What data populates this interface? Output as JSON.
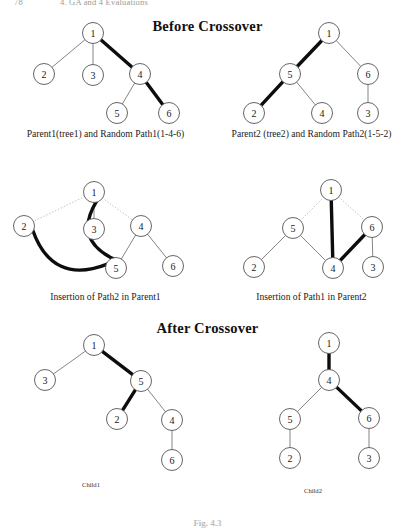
{
  "running_head": {
    "folio": "78",
    "text": "4. GA and 4 Evaluations"
  },
  "figure_number": "Fig. 4.3",
  "headings": {
    "before": "Before Crossover",
    "after": "After Crossover"
  },
  "captions": {
    "parent1": "Parent1(tree1) and Random Path1(1-4-6)",
    "parent2": "Parent2 (tree2) and Random Path2(1-5-2)",
    "insertion1": "Insertion of Path2  in Parent1",
    "insertion2": "Insertion of Path1  in Parent2",
    "child1": "Child1",
    "child2": "Child2"
  },
  "colors": {
    "node_fill": "#ffffff",
    "node_stroke": "#555555",
    "edge_thin": "#6f6f6f",
    "edge_bold": "#0d0d0d",
    "edge_dotted": "#a9a9a9",
    "text": "#1a1a1a"
  },
  "diagrams": [
    {
      "id": "parent1",
      "name": "Parent1 tree with highlighted random path 1-4-6",
      "nodes": [
        {
          "label": "1",
          "x": 93,
          "y": 33
        },
        {
          "label": "2",
          "x": 44,
          "y": 74
        },
        {
          "label": "3",
          "x": 93,
          "y": 75
        },
        {
          "label": "4",
          "x": 140,
          "y": 74
        },
        {
          "label": "5",
          "x": 117,
          "y": 113
        },
        {
          "label": "6",
          "x": 169,
          "y": 113
        }
      ],
      "edges": [
        {
          "from": "1",
          "to": "2",
          "style": "thin"
        },
        {
          "from": "1",
          "to": "3",
          "style": "thin"
        },
        {
          "from": "1",
          "to": "4",
          "style": "bold"
        },
        {
          "from": "4",
          "to": "5",
          "style": "thin"
        },
        {
          "from": "4",
          "to": "6",
          "style": "bold"
        }
      ],
      "highlighted_path": [
        "1",
        "4",
        "6"
      ]
    },
    {
      "id": "parent2",
      "name": "Parent2 tree with highlighted random path 1-5-2",
      "nodes": [
        {
          "label": "1",
          "x": 329,
          "y": 33
        },
        {
          "label": "5",
          "x": 290,
          "y": 74
        },
        {
          "label": "6",
          "x": 368,
          "y": 74
        },
        {
          "label": "2",
          "x": 254,
          "y": 113
        },
        {
          "label": "4",
          "x": 322,
          "y": 113
        },
        {
          "label": "3",
          "x": 368,
          "y": 113
        }
      ],
      "edges": [
        {
          "from": "1",
          "to": "5",
          "style": "bold"
        },
        {
          "from": "1",
          "to": "6",
          "style": "thin"
        },
        {
          "from": "5",
          "to": "2",
          "style": "bold"
        },
        {
          "from": "5",
          "to": "4",
          "style": "thin"
        },
        {
          "from": "6",
          "to": "3",
          "style": "thin"
        }
      ],
      "highlighted_path": [
        "1",
        "5",
        "2"
      ]
    },
    {
      "id": "insertion1",
      "name": "Insertion of Path2 in Parent1",
      "nodes": [
        {
          "label": "1",
          "x": 94,
          "y": 192
        },
        {
          "label": "2",
          "x": 24,
          "y": 226
        },
        {
          "label": "3",
          "x": 94,
          "y": 229
        },
        {
          "label": "4",
          "x": 141,
          "y": 226
        },
        {
          "label": "5",
          "x": 116,
          "y": 268
        },
        {
          "label": "6",
          "x": 173,
          "y": 266
        }
      ],
      "edges": [
        {
          "from": "1",
          "to": "2",
          "style": "dotted"
        },
        {
          "from": "1",
          "to": "3",
          "style": "thin"
        },
        {
          "from": "1",
          "to": "4",
          "style": "dotted"
        },
        {
          "from": "1",
          "to": "5",
          "style": "bold-curve"
        },
        {
          "from": "2",
          "to": "5",
          "style": "bold-curve"
        },
        {
          "from": "4",
          "to": "5",
          "style": "thin"
        },
        {
          "from": "4",
          "to": "6",
          "style": "thin"
        }
      ],
      "inserted_path": [
        "1",
        "5",
        "2"
      ]
    },
    {
      "id": "insertion2",
      "name": "Insertion of Path1 in Parent2",
      "nodes": [
        {
          "label": "1",
          "x": 331,
          "y": 190
        },
        {
          "label": "5",
          "x": 293,
          "y": 228
        },
        {
          "label": "6",
          "x": 372,
          "y": 227
        },
        {
          "label": "2",
          "x": 254,
          "y": 267
        },
        {
          "label": "4",
          "x": 333,
          "y": 268
        },
        {
          "label": "3",
          "x": 373,
          "y": 267
        }
      ],
      "edges": [
        {
          "from": "1",
          "to": "5",
          "style": "dotted"
        },
        {
          "from": "1",
          "to": "6",
          "style": "dotted"
        },
        {
          "from": "1",
          "to": "4",
          "style": "bold"
        },
        {
          "from": "5",
          "to": "2",
          "style": "thin"
        },
        {
          "from": "5",
          "to": "4",
          "style": "thin"
        },
        {
          "from": "4",
          "to": "6",
          "style": "bold"
        },
        {
          "from": "6",
          "to": "3",
          "style": "thin"
        }
      ],
      "inserted_path": [
        "1",
        "4",
        "6"
      ]
    },
    {
      "id": "child1",
      "name": "Child1 resulting tree",
      "nodes": [
        {
          "label": "1",
          "x": 94,
          "y": 345
        },
        {
          "label": "3",
          "x": 45,
          "y": 380
        },
        {
          "label": "5",
          "x": 141,
          "y": 381
        },
        {
          "label": "2",
          "x": 117,
          "y": 419
        },
        {
          "label": "4",
          "x": 172,
          "y": 420
        },
        {
          "label": "6",
          "x": 172,
          "y": 460
        }
      ],
      "edges": [
        {
          "from": "1",
          "to": "3",
          "style": "thin"
        },
        {
          "from": "1",
          "to": "5",
          "style": "bold"
        },
        {
          "from": "5",
          "to": "2",
          "style": "bold"
        },
        {
          "from": "5",
          "to": "4",
          "style": "thin"
        },
        {
          "from": "4",
          "to": "6",
          "style": "thin"
        }
      ]
    },
    {
      "id": "child2",
      "name": "Child2 resulting tree",
      "nodes": [
        {
          "label": "1",
          "x": 329,
          "y": 343
        },
        {
          "label": "4",
          "x": 329,
          "y": 380
        },
        {
          "label": "5",
          "x": 290,
          "y": 419
        },
        {
          "label": "6",
          "x": 369,
          "y": 418
        },
        {
          "label": "2",
          "x": 290,
          "y": 458
        },
        {
          "label": "3",
          "x": 369,
          "y": 458
        }
      ],
      "edges": [
        {
          "from": "1",
          "to": "4",
          "style": "bold"
        },
        {
          "from": "4",
          "to": "5",
          "style": "thin"
        },
        {
          "from": "4",
          "to": "6",
          "style": "bold"
        },
        {
          "from": "5",
          "to": "2",
          "style": "thin"
        },
        {
          "from": "6",
          "to": "3",
          "style": "thin"
        }
      ]
    }
  ]
}
